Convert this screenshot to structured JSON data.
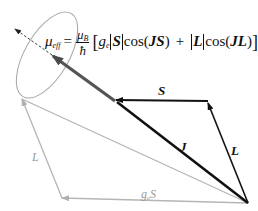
{
  "diagram": {
    "type": "vector-model",
    "formula": {
      "lhs": "μ",
      "lhs_sub": "eff",
      "equals": "=",
      "frac_num": "μ",
      "frac_num_sub": "B",
      "frac_den": "ħ",
      "open_bracket": "[",
      "g": "g",
      "g_sub": "e",
      "S": "S",
      "cos1": "cos(",
      "JS": "JS",
      "close1": ")",
      "plus": "+",
      "L": "L",
      "cos2": "cos(",
      "JL": "JL",
      "close2": ")",
      "close_bracket": "]"
    },
    "labels": {
      "S": "S",
      "J": "J",
      "L_black": "L",
      "L_gray": "L",
      "gS_g": "g",
      "gS_sub": "e",
      "gS_S": "S"
    },
    "colors": {
      "black_vectors": "#111111",
      "J_vector": "#3a3a3a",
      "mu_vector": "#555555",
      "gray_vectors": "#b0b0b0",
      "ellipse": "#a8a8a8"
    },
    "points": {
      "origin": [
        248,
        203
      ],
      "S_L_corner": [
        208,
        101
      ],
      "J_tip": [
        114,
        100
      ],
      "mu_tip": [
        52,
        55
      ],
      "dashed_tip": [
        14,
        28
      ],
      "gray_apex": [
        22,
        99
      ],
      "gray_corner": [
        62,
        198
      ]
    }
  }
}
